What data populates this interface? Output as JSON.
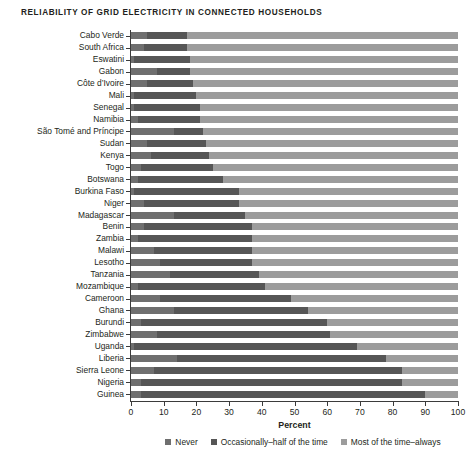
{
  "chart_data": {
    "type": "bar",
    "subtype": "stacked-horizontal-100pct",
    "title": "RELIABILITY OF GRID ELECTRICITY IN CONNECTED HOUSEHOLDS",
    "xlabel": "Percent",
    "ylabel": "",
    "xlim": [
      0,
      100
    ],
    "xticks": [
      0,
      10,
      20,
      30,
      40,
      50,
      60,
      70,
      80,
      90,
      100
    ],
    "xticklabels": [
      "0",
      "10",
      "20",
      "30",
      "40",
      "50",
      "60",
      "70",
      "80",
      "90",
      "100"
    ],
    "grid": false,
    "legend_position": "bottom",
    "categories": [
      "Cabo Verde",
      "South Africa",
      "Eswatini",
      "Gabon",
      "Côte d’Ivoire",
      "Mali",
      "Senegal",
      "Namibia",
      "São Tomé and Príncipe",
      "Sudan",
      "Kenya",
      "Togo",
      "Botswana",
      "Burkina Faso",
      "Niger",
      "Madagascar",
      "Benin",
      "Zambia",
      "Malawi",
      "Lesotho",
      "Tanzania",
      "Mozambique",
      "Cameroon",
      "Ghana",
      "Burundi",
      "Zimbabwe",
      "Uganda",
      "Liberia",
      "Sierra Leone",
      "Nigeria",
      "Guinea"
    ],
    "series": [
      {
        "name": "Never",
        "color": "#6f6f6f",
        "values": [
          5,
          4,
          1,
          8,
          5,
          1,
          1,
          2,
          13,
          5,
          6,
          3,
          2,
          1,
          4,
          13,
          4,
          2,
          7,
          9,
          12,
          2,
          9,
          13,
          3,
          8,
          1,
          14,
          7,
          3,
          3
        ]
      },
      {
        "name": "Occasionally–half of the time",
        "color": "#565656",
        "values": [
          12,
          13,
          17,
          10,
          14,
          19,
          20,
          19,
          9,
          18,
          18,
          22,
          26,
          32,
          29,
          22,
          33,
          35,
          30,
          28,
          27,
          39,
          40,
          41,
          57,
          53,
          68,
          64,
          76,
          80,
          87
        ]
      },
      {
        "name": "Most of the time–always",
        "color": "#9c9c9c",
        "values": [
          83,
          83,
          82,
          82,
          81,
          80,
          79,
          79,
          78,
          77,
          76,
          75,
          72,
          67,
          67,
          65,
          63,
          63,
          63,
          63,
          61,
          59,
          51,
          46,
          40,
          39,
          31,
          22,
          17,
          17,
          10
        ]
      }
    ]
  },
  "legend": {
    "items": [
      {
        "label": "Never",
        "color": "#6f6f6f"
      },
      {
        "label": "Occasionally–half of the time",
        "color": "#565656"
      },
      {
        "label": "Most of the time–always",
        "color": "#9c9c9c"
      }
    ]
  }
}
